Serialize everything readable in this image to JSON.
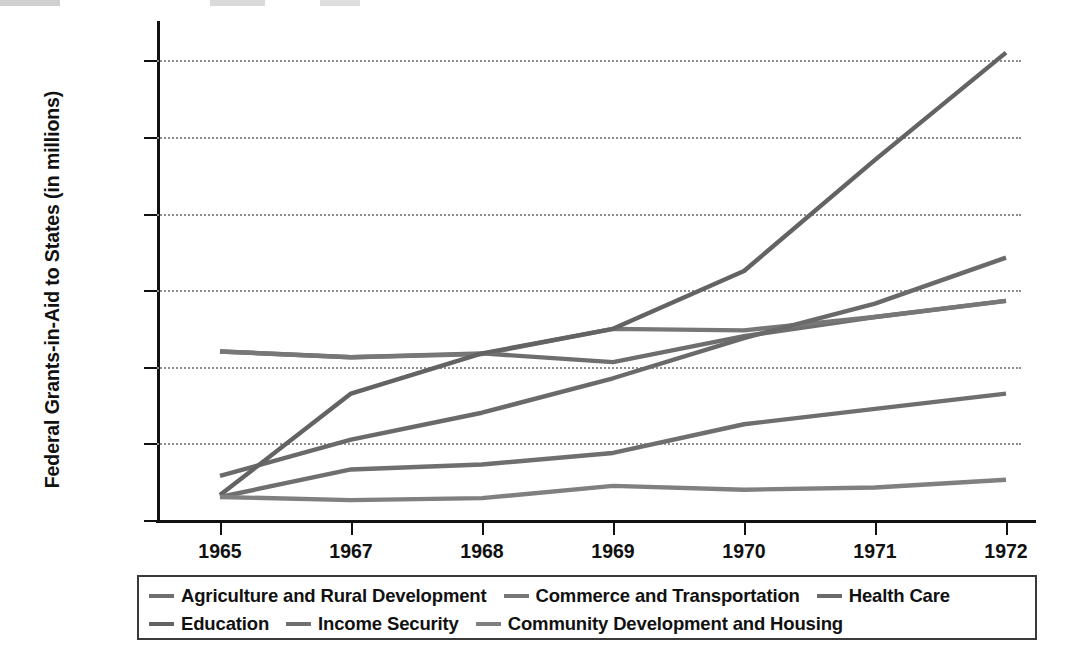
{
  "chart_data": {
    "type": "line",
    "title": "",
    "xlabel": "",
    "ylabel": "Federal Grants-in-Aid to States (in millions)",
    "x": [
      "1965",
      "1967",
      "1968",
      "1969",
      "1970",
      "1971",
      "1972"
    ],
    "categories": [
      "1965",
      "1967",
      "1968",
      "1969",
      "1970",
      "1971",
      "1972"
    ],
    "ylim": [
      0,
      13000
    ],
    "ytick_values": [
      0,
      2000,
      4000,
      6000,
      8000,
      10000,
      12000
    ],
    "ytick_labels": [
      "$0",
      "$2,000",
      "$4,000",
      "$6,000",
      "$8,000",
      "$10,000",
      "$12,000"
    ],
    "grid": "horizontal-dotted",
    "legend_position": "bottom",
    "series": [
      {
        "name": "Agriculture and Rural Development",
        "color": "#6e6e6e",
        "values": [
          4400,
          4250,
          4350,
          4120,
          4800,
          5300,
          5720
        ]
      },
      {
        "name": "Commerce and Transportation",
        "color": "#777777",
        "values": [
          4400,
          4250,
          4330,
          4990,
          4950,
          5300,
          5720
        ]
      },
      {
        "name": "Health Care",
        "color": "#6a6a6a",
        "values": [
          1150,
          2100,
          2800,
          3700,
          4750,
          5650,
          6850
        ]
      },
      {
        "name": "Education",
        "color": "#636363",
        "values": [
          650,
          3300,
          4350,
          4990,
          6500,
          9400,
          12200
        ]
      },
      {
        "name": "Income Security",
        "color": "#6f6f6f",
        "values": [
          600,
          1320,
          1450,
          1750,
          2500,
          2900,
          3300
        ]
      },
      {
        "name": "Community Development and Housing",
        "color": "#808080",
        "values": [
          600,
          520,
          570,
          890,
          790,
          850,
          1050
        ]
      }
    ]
  },
  "legend": {
    "rows": [
      [
        "Agriculture and Rural Development",
        "Commerce and Transportation",
        "Health Care"
      ],
      [
        "Education",
        "Income Security",
        "Community Development and Housing"
      ]
    ]
  },
  "colors": {
    "axis": "#111111",
    "grid": "#8d8d8d",
    "background": "#ffffff",
    "line_default": "#6e6e6e"
  }
}
